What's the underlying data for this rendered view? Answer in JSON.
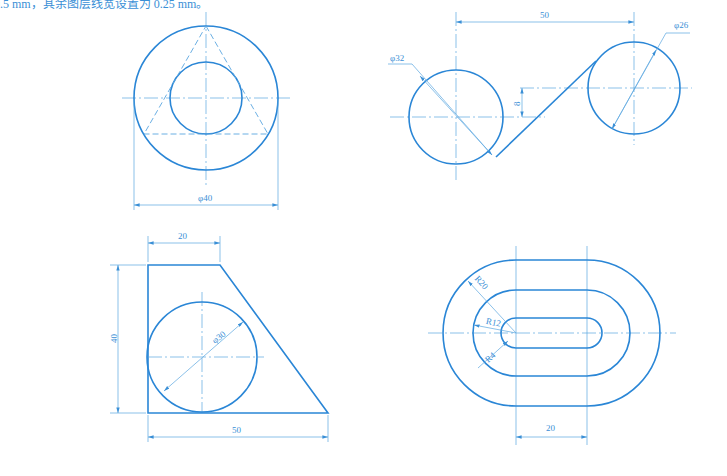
{
  "header": {
    "text": "0.5 mm，其余图层线宽设置为 0.25 mm。"
  },
  "colors": {
    "line": "#2a86d6",
    "thin_line": "#5aa6e0",
    "text": "#3a8fd6",
    "background": "#ffffff"
  },
  "figures": [
    {
      "id": "fig1",
      "description": "Concentric circles with inscribed hidden triangle",
      "dimensions": {
        "outer_diameter": "φ40"
      }
    },
    {
      "id": "fig2",
      "description": "Two circles joined by a tangent line",
      "dimensions": {
        "center_distance": "50",
        "left_diameter": "φ32",
        "right_diameter": "φ26",
        "vertical_offset": "8"
      }
    },
    {
      "id": "fig3",
      "description": "Trapezoid with inscribed circle",
      "dimensions": {
        "top_width": "20",
        "height": "40",
        "bottom_width": "50",
        "circle_diameter": "φ30"
      }
    },
    {
      "id": "fig4",
      "description": "Nested slot / obround shapes",
      "dimensions": {
        "outer_radius": "R20",
        "middle_radius": "R12",
        "inner_radius": "R4",
        "center_distance": "20"
      }
    }
  ]
}
